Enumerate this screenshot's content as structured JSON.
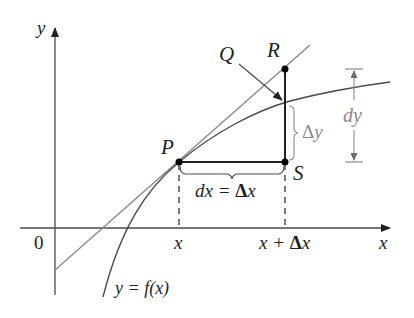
{
  "figure": {
    "labels": {
      "y_axis": "y",
      "x_axis": "x",
      "origin": "0",
      "x_tick": "x",
      "x_plus_dx_tick_a": "x + ",
      "x_plus_dx_delta": "Δ",
      "x_plus_dx_x": "x",
      "point_P": "P",
      "point_Q": "Q",
      "point_R": "R",
      "point_S": "S",
      "dx_eq_a": "dx = ",
      "dx_eq_delta": "Δ",
      "dx_eq_x": "x",
      "delta_y_delta": "Δ",
      "delta_y_y": "y",
      "dy": "dy",
      "curve_label": "y = f(x)"
    },
    "colors": {
      "ink": "#231f20",
      "gray_line": "#8a8a8a",
      "background": "#ffffff"
    }
  }
}
